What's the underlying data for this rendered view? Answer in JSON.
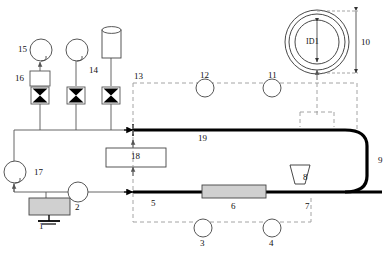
{
  "diagram": {
    "colors": {
      "line": "#444444",
      "pipe": "#000000",
      "dashed": "#9a9a9a",
      "fill_gray": "#d0d0d0",
      "text": "#111111"
    }
  },
  "labels": {
    "n1": "1",
    "n2": "2",
    "n3": "3",
    "n4": "4",
    "n5": "5",
    "n6": "6",
    "n7": "7",
    "n8": "8",
    "n9": "9",
    "n10": "10",
    "n11": "11",
    "n12": "12",
    "n13": "13",
    "n14": "14",
    "n15": "15",
    "n16": "16",
    "n17": "17",
    "n18": "18",
    "n19": "19",
    "id1": "ID1"
  },
  "components": [
    {
      "id": "1",
      "name": "reservoir-tank",
      "shape": "gray-rectangle-with-ground"
    },
    {
      "id": "2",
      "name": "pump-circle",
      "shape": "circle"
    },
    {
      "id": "3",
      "name": "instrument-circle-3",
      "shape": "circle"
    },
    {
      "id": "4",
      "name": "instrument-circle-4",
      "shape": "circle"
    },
    {
      "id": "5",
      "name": "lower-pipe-run",
      "shape": "thick-line"
    },
    {
      "id": "6",
      "name": "test-section",
      "shape": "gray-rectangle"
    },
    {
      "id": "7",
      "name": "pipe-segment-7",
      "shape": "thick-line"
    },
    {
      "id": "8",
      "name": "nozzle-trapezoid",
      "shape": "trapezoid"
    },
    {
      "id": "9",
      "name": "return-bend",
      "shape": "rounded-bend"
    },
    {
      "id": "10",
      "name": "outer-diameter-dimension",
      "shape": "dimension-arrow"
    },
    {
      "id": "11",
      "name": "instrument-circle-11",
      "shape": "circle"
    },
    {
      "id": "12",
      "name": "instrument-circle-12",
      "shape": "circle"
    },
    {
      "id": "13",
      "name": "control-boundary",
      "shape": "dashed-boundary"
    },
    {
      "id": "14",
      "name": "gas-cylinder",
      "shape": "cylinder"
    },
    {
      "id": "15",
      "name": "balloon-gauge",
      "shape": "balloon"
    },
    {
      "id": "16",
      "name": "filter-box",
      "shape": "rectangle"
    },
    {
      "id": "17",
      "name": "circulation-gauge",
      "shape": "balloon"
    },
    {
      "id": "18",
      "name": "control-box-18",
      "shape": "rectangle"
    },
    {
      "id": "19",
      "name": "upper-pipe-run",
      "shape": "thick-line"
    }
  ]
}
